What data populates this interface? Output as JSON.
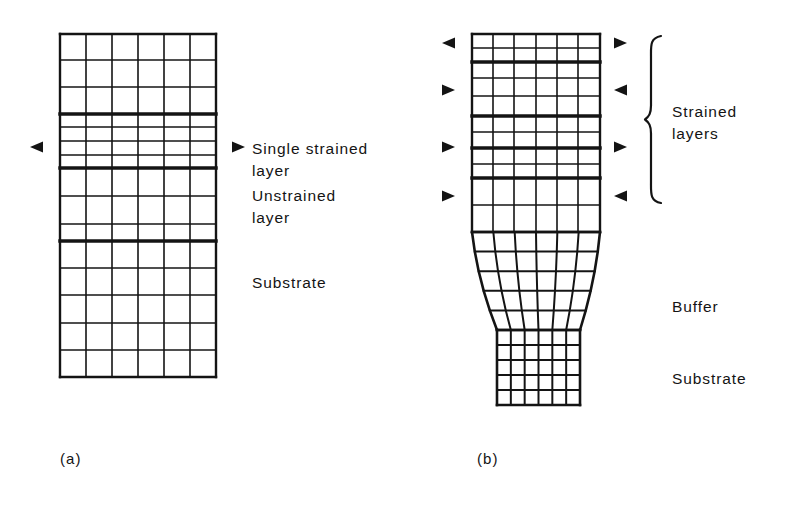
{
  "figure": {
    "background": "#ffffff",
    "ink": "#141414"
  },
  "panels": [
    {
      "id": "a",
      "caption": "(a)",
      "caption_pos": {
        "x": 60,
        "y": 450
      },
      "grid": {
        "x": 60,
        "y": 34,
        "width": 156,
        "height": 343,
        "columns": 6,
        "col_x": [
          60,
          86,
          112,
          138,
          164,
          190,
          216
        ],
        "row_y": [
          34,
          60,
          87,
          114,
          127,
          141,
          155,
          168,
          196,
          224,
          241,
          268,
          295,
          323,
          350,
          377
        ],
        "thick_rows_y": [
          114,
          168,
          241
        ],
        "thin_stroke": 1.6,
        "thick_stroke": 3.4,
        "border_stroke": 2.4
      },
      "markers": [
        {
          "name": "left-arrow-strained-layer",
          "glyph": "left-triangle",
          "x": 30,
          "y": 147
        },
        {
          "name": "right-arrow-strained-layer",
          "glyph": "right-triangle",
          "x": 232,
          "y": 147
        }
      ],
      "labels": [
        {
          "name": "label-single-strained-layer",
          "text": "Single strained\nlayer",
          "x": 252,
          "y": 138
        },
        {
          "name": "label-unstrained-layer",
          "text": "Unstrained\nlayer",
          "x": 252,
          "y": 185
        },
        {
          "name": "label-substrate",
          "text": "Substrate",
          "x": 252,
          "y": 272
        }
      ]
    },
    {
      "id": "b",
      "caption": "(b)",
      "caption_pos": {
        "x": 477,
        "y": 450
      },
      "top": {
        "x": 472,
        "y": 34,
        "width": 128,
        "height": 198,
        "columns": 6,
        "col_x": [
          472,
          493,
          514,
          536,
          557,
          578,
          600
        ],
        "row_y": [
          34,
          48,
          62,
          78,
          96,
          116,
          132,
          148,
          164,
          178,
          205,
          232
        ],
        "thick_rows_y": [
          62,
          116,
          148,
          178
        ],
        "thin_stroke": 1.6,
        "thick_stroke": 3.4
      },
      "buffer": {
        "y_top": 232,
        "y_bottom": 330,
        "x_left_top": 472,
        "x_right_top": 600,
        "x_left_bottom": 497,
        "x_right_bottom": 580,
        "columns": 6,
        "rows": 5,
        "stroke": 2.0
      },
      "substrate": {
        "x": 497,
        "y": 330,
        "width": 83,
        "height": 75,
        "columns": 6,
        "rows": 5,
        "stroke": 2.0
      },
      "markers": [
        {
          "name": "left-arrow-strained-1",
          "glyph": "left-triangle",
          "x": 442,
          "y": 43
        },
        {
          "name": "left-arrow-strained-2",
          "glyph": "right-triangle",
          "x": 442,
          "y": 90
        },
        {
          "name": "left-arrow-strained-3",
          "glyph": "right-triangle",
          "x": 442,
          "y": 147
        },
        {
          "name": "left-arrow-strained-4",
          "glyph": "right-triangle",
          "x": 442,
          "y": 196
        },
        {
          "name": "right-arrow-strained-1",
          "glyph": "right-triangle",
          "x": 614,
          "y": 43
        },
        {
          "name": "right-arrow-strained-2",
          "glyph": "left-triangle",
          "x": 614,
          "y": 90
        },
        {
          "name": "right-arrow-strained-3",
          "glyph": "right-triangle",
          "x": 614,
          "y": 147
        },
        {
          "name": "right-arrow-strained-4",
          "glyph": "left-triangle",
          "x": 614,
          "y": 196
        }
      ],
      "brace": {
        "name": "strained-layers-brace",
        "x": 648,
        "y_top": 36,
        "y_bottom": 203,
        "width": 13,
        "stroke": 2.2
      },
      "labels": [
        {
          "name": "label-strained-layers",
          "text": "Strained\nlayers",
          "x": 672,
          "y": 101
        },
        {
          "name": "label-buffer",
          "text": "Buffer",
          "x": 672,
          "y": 296
        },
        {
          "name": "label-substrate-b",
          "text": "Substrate",
          "x": 672,
          "y": 368
        }
      ]
    }
  ],
  "icons": {
    "left-triangle": "◄",
    "right-triangle": "►"
  }
}
